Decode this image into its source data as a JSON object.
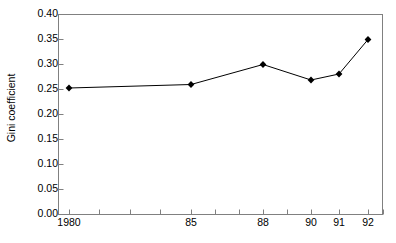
{
  "chart_data": {
    "type": "line",
    "title": "",
    "subtitle": "",
    "xlabel": "",
    "ylabel": "Gini coefficient",
    "ylim": [
      0.0,
      0.4
    ],
    "ytick_labels": [
      "0.40",
      "0.35",
      "0.30",
      "0.25",
      "0.20",
      "0.15",
      "0.10",
      "0.05",
      "0.00"
    ],
    "ytick_values": [
      0.4,
      0.35,
      0.3,
      0.25,
      0.2,
      0.15,
      0.1,
      0.05,
      0.0
    ],
    "xtick_labels": [
      "1980",
      "85",
      "88",
      "90",
      "91",
      "92"
    ],
    "x": [
      "1980",
      "85",
      "88",
      "90",
      "91",
      "92"
    ],
    "values": [
      0.252,
      0.259,
      0.299,
      0.268,
      0.28,
      0.349
    ],
    "series": [
      {
        "name": "Gini coefficient",
        "values": [
          0.252,
          0.259,
          0.299,
          0.268,
          0.28,
          0.349
        ]
      }
    ],
    "grid": false,
    "legend": "none",
    "marker": "diamond",
    "line_color": "#000000",
    "marker_color": "#000000",
    "plot_background": "#ffffff",
    "axis_color": "#808080",
    "annotations": []
  },
  "layout": {
    "plot_left": 58,
    "plot_right": 383,
    "plot_top": 14,
    "plot_bottom": 214,
    "point_x": [
      69,
      191,
      263,
      311,
      339,
      368
    ],
    "xtick_label_x": [
      69,
      191,
      263,
      311,
      339,
      368
    ],
    "xtick_positions": [
      69,
      99,
      130,
      160,
      191,
      215,
      239,
      263,
      287,
      311,
      339,
      368,
      383
    ],
    "ytick_y": [
      14,
      39,
      64,
      89,
      114,
      139,
      164,
      189,
      214
    ]
  }
}
